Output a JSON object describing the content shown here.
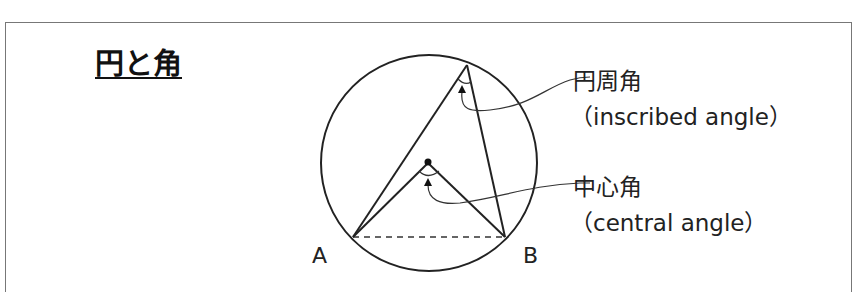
{
  "title": "円と角",
  "labels": {
    "inscribed_jp": "円周角",
    "inscribed_en": "（inscribed angle）",
    "central_jp": "中心角",
    "central_en": "（central angle）"
  },
  "points": {
    "a": "A",
    "b": "B"
  },
  "colors": {
    "line": "#222222",
    "frame": "#777777"
  }
}
